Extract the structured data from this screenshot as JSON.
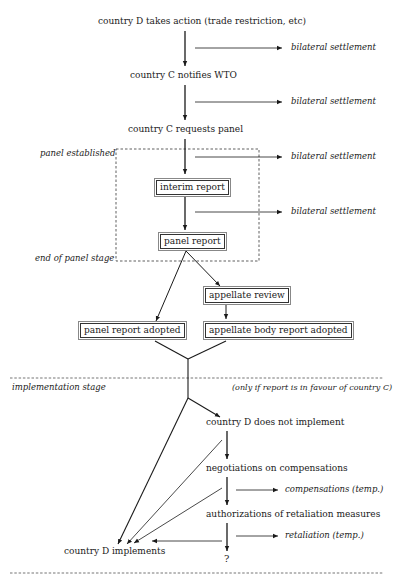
{
  "nodes": {
    "d_action": "country D takes action (trade restriction, etc)",
    "c_notifies": "country C notifies WTO",
    "c_requests": "country C requests panel",
    "interim": "interim report",
    "panel_report": "panel report",
    "appellate_review": "appellate review",
    "panel_adopted": "panel report adopted",
    "appellate_adopted": "appellate body report adopted",
    "d_not_implement": "country D does not implement",
    "negotiations": "negotiations on compensations",
    "authorizations": "authorizations of retaliation measures",
    "d_implements": "country D implements",
    "unknown": "?"
  },
  "side_outcomes": {
    "bilateral_1": "bilateral settlement",
    "bilateral_2": "bilateral settlement",
    "bilateral_3": "bilateral settlement",
    "bilateral_4": "bilateral settlement",
    "compensations": "compensations (temp.)",
    "retaliation": "retaliation (temp.)"
  },
  "stage_labels": {
    "panel_established": "panel established",
    "end_panel_stage": "end of panel stage",
    "implementation_stage": "implementation stage",
    "condition_note": "(only if report is in favour of country C)"
  }
}
